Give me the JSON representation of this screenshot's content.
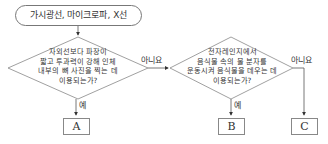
{
  "diagram": {
    "start": {
      "label": "가시광선, 마이크로파, X선"
    },
    "decisions": [
      {
        "id": "q1",
        "lines": [
          "자외선보다 파장이",
          "짧고 투과력이 강해 인체",
          "내부의 뼈 사진을 찍는 데",
          "이용되는가?"
        ]
      },
      {
        "id": "q2",
        "lines": [
          "전자레인지에서",
          "음식물 속의 물 분자를",
          "운동시켜 음식물을 데우는 데",
          "이용되는가?"
        ]
      }
    ],
    "edge_labels": {
      "yes": "예",
      "no": "아니요"
    },
    "outcomes": [
      {
        "id": "A",
        "label": "A"
      },
      {
        "id": "B",
        "label": "B"
      },
      {
        "id": "C",
        "label": "C"
      }
    ],
    "colors": {
      "line": "#666666",
      "text": "#333333"
    }
  }
}
